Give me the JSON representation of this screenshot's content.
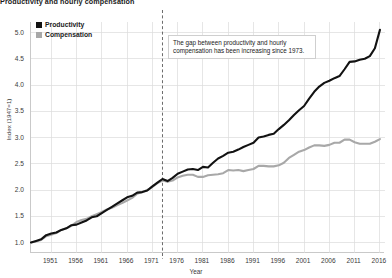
{
  "chart_data": {
    "type": "line",
    "title": "Productivity and hourly compensation",
    "xlabel": "Year",
    "ylabel": "Index (1947=1)",
    "xlim": [
      1947,
      2017
    ],
    "ylim": [
      0.8,
      5.2
    ],
    "grid": true,
    "legend_position": "top-left",
    "xticks": [
      "1951",
      "1956",
      "1961",
      "1966",
      "1971",
      "1976",
      "1981",
      "1986",
      "1991",
      "1996",
      "2001",
      "2006",
      "2011",
      "2016"
    ],
    "xtick_values": [
      1951,
      1956,
      1961,
      1966,
      1971,
      1976,
      1981,
      1986,
      1991,
      1996,
      2001,
      2006,
      2011,
      2016
    ],
    "yticks": [
      "1.0",
      "1.5",
      "2.0",
      "2.5",
      "3.0",
      "3.5",
      "4.0",
      "4.5",
      "5.0"
    ],
    "ytick_values": [
      1.0,
      1.5,
      2.0,
      2.5,
      3.0,
      3.5,
      4.0,
      4.5,
      5.0
    ],
    "annotations": [
      {
        "text": "The gap between productivity and hourly compensation has been increasing since 1973.",
        "x": 1973
      }
    ],
    "event_line": {
      "x": 1973,
      "style": "dashed"
    },
    "colors": {
      "productivity": "#121212",
      "compensation": "#a8a8a8"
    },
    "x": [
      1947,
      1948,
      1949,
      1950,
      1951,
      1952,
      1953,
      1954,
      1955,
      1956,
      1957,
      1958,
      1959,
      1960,
      1961,
      1962,
      1963,
      1964,
      1965,
      1966,
      1967,
      1968,
      1969,
      1970,
      1971,
      1972,
      1973,
      1974,
      1975,
      1976,
      1977,
      1978,
      1979,
      1980,
      1981,
      1982,
      1983,
      1984,
      1985,
      1986,
      1987,
      1988,
      1989,
      1990,
      1991,
      1992,
      1993,
      1994,
      1995,
      1996,
      1997,
      1998,
      1999,
      2000,
      2001,
      2002,
      2003,
      2004,
      2005,
      2006,
      2007,
      2008,
      2009,
      2010,
      2011,
      2012,
      2013,
      2014,
      2015,
      2016
    ],
    "series": [
      {
        "name": "Productivity",
        "color": "#121212",
        "values": [
          1.0,
          1.03,
          1.06,
          1.14,
          1.17,
          1.19,
          1.24,
          1.27,
          1.33,
          1.34,
          1.38,
          1.42,
          1.48,
          1.5,
          1.56,
          1.62,
          1.68,
          1.74,
          1.8,
          1.86,
          1.89,
          1.95,
          1.96,
          1.99,
          2.07,
          2.14,
          2.21,
          2.17,
          2.23,
          2.31,
          2.35,
          2.39,
          2.4,
          2.38,
          2.44,
          2.43,
          2.52,
          2.6,
          2.65,
          2.71,
          2.73,
          2.77,
          2.82,
          2.86,
          2.9,
          3.0,
          3.02,
          3.05,
          3.07,
          3.16,
          3.24,
          3.33,
          3.43,
          3.52,
          3.6,
          3.74,
          3.87,
          3.97,
          4.04,
          4.08,
          4.13,
          4.17,
          4.3,
          4.44,
          4.45,
          4.48,
          4.5,
          4.55,
          4.7,
          5.05
        ]
      },
      {
        "name": "Compensation",
        "color": "#a8a8a8",
        "values": [
          1.0,
          1.02,
          1.05,
          1.12,
          1.15,
          1.18,
          1.24,
          1.27,
          1.32,
          1.39,
          1.43,
          1.45,
          1.5,
          1.54,
          1.58,
          1.63,
          1.66,
          1.71,
          1.75,
          1.8,
          1.85,
          1.93,
          1.96,
          2.0,
          2.06,
          2.13,
          2.18,
          2.16,
          2.18,
          2.24,
          2.27,
          2.29,
          2.29,
          2.25,
          2.25,
          2.28,
          2.29,
          2.3,
          2.32,
          2.38,
          2.37,
          2.38,
          2.36,
          2.38,
          2.4,
          2.46,
          2.46,
          2.45,
          2.45,
          2.47,
          2.52,
          2.61,
          2.67,
          2.73,
          2.76,
          2.81,
          2.85,
          2.85,
          2.84,
          2.86,
          2.9,
          2.9,
          2.96,
          2.96,
          2.91,
          2.88,
          2.88,
          2.88,
          2.92,
          2.97
        ]
      }
    ]
  },
  "legend": {
    "items": [
      {
        "label": "Productivity",
        "color": "#121212"
      },
      {
        "label": "Compensation",
        "color": "#a8a8a8"
      }
    ]
  }
}
